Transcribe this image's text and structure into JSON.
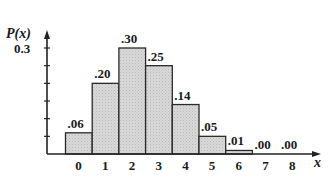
{
  "chart_data": {
    "type": "bar",
    "title": "",
    "xlabel": "x",
    "ylabel": "P(x)",
    "categories": [
      "0",
      "1",
      "2",
      "3",
      "4",
      "5",
      "6",
      "7",
      "8"
    ],
    "values": [
      0.06,
      0.2,
      0.3,
      0.25,
      0.14,
      0.05,
      0.01,
      0.0,
      0.0
    ],
    "value_labels": [
      ".06",
      ".20",
      ".30",
      ".25",
      ".14",
      ".05",
      ".01",
      ".00",
      ".00"
    ],
    "ylim": [
      0,
      0.33
    ],
    "yticks": [
      0.05,
      0.1,
      0.15,
      0.2,
      0.25,
      0.3
    ],
    "ytick_labels_shown": {
      "0.3": "0.3"
    },
    "grid": false,
    "legend": null,
    "bar_fill": "#d4d4d4",
    "bar_edge": "#2a2a2a"
  },
  "axis": {
    "y_label": "P(x)",
    "y_tick_label": "0.3",
    "x_label": "x"
  }
}
